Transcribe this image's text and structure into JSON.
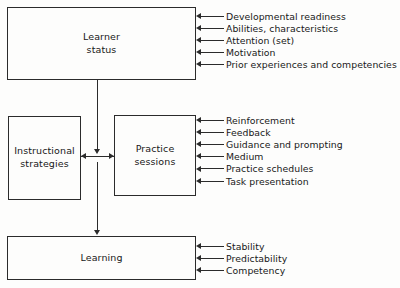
{
  "diagram": {
    "colors": {
      "line": "#2b2b2b",
      "text": "#181818",
      "background": "#fdfdfc"
    },
    "nodes": {
      "learner": {
        "label": "Learner\nstatus",
        "line1": "Learner",
        "line2": "status"
      },
      "strategies": {
        "label": "Instructional\nstrategies",
        "line1": "Instructional",
        "line2": "strategies"
      },
      "practice": {
        "label": "Practice sessions"
      },
      "learning": {
        "label": "Learning"
      }
    },
    "annotations": {
      "learner": [
        "Developmental readiness",
        "Abilities, characteristics",
        "Attention (set)",
        "Motivation",
        "Prior experiences and competencies"
      ],
      "practice": [
        "Reinforcement",
        "Feedback",
        "Guidance and prompting",
        "Medium",
        "Practice schedules",
        "Task presentation"
      ],
      "learning": [
        "Stability",
        "Predictability",
        "Competency"
      ]
    },
    "connections": [
      {
        "from": "learner",
        "to": "practice",
        "type": "arrow-down"
      },
      {
        "from": "strategies",
        "to": "practice",
        "type": "bidirectional"
      },
      {
        "from": "practice",
        "to": "learning",
        "type": "arrow-down"
      }
    ]
  }
}
